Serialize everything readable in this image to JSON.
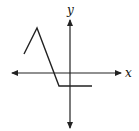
{
  "figure": {
    "x_axis_label": "x",
    "y_axis_label": "y",
    "colors": {
      "line": "#222222",
      "axis": "#222222",
      "background": "#ffffff"
    },
    "graph_points": [
      [
        24,
        54
      ],
      [
        37,
        28
      ],
      [
        59,
        86
      ],
      [
        92,
        86
      ]
    ]
  }
}
